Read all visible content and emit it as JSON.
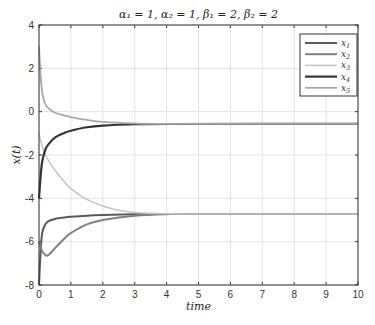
{
  "chart_data": {
    "type": "line",
    "title": "α₁ = 1, α₂ = 1, β₁ = 2, β₂ = 2",
    "xlabel": "time",
    "ylabel": "x(t)",
    "xlim": [
      0,
      10
    ],
    "ylim": [
      -8,
      4
    ],
    "xticks": [
      "0",
      "1",
      "2",
      "3",
      "4",
      "5",
      "6",
      "7",
      "8",
      "9",
      "10"
    ],
    "yticks": [
      "4",
      "2",
      "0",
      "-2",
      "-4",
      "-6",
      "-8"
    ],
    "grid": true,
    "legend_position": "upper right",
    "series": [
      {
        "name": "x1",
        "label_main": "x",
        "label_sub": "1",
        "color": "#5a5a5a",
        "width": 2,
        "x": [
          0,
          0.05,
          0.1,
          0.2,
          0.3,
          0.5,
          0.8,
          1,
          1.5,
          2,
          3,
          4,
          5,
          10
        ],
        "y": [
          -8,
          -6.5,
          -5.6,
          -5.2,
          -5.05,
          -4.95,
          -4.88,
          -4.85,
          -4.8,
          -4.77,
          -4.73,
          -4.72,
          -4.72,
          -4.72
        ]
      },
      {
        "name": "x2",
        "label_main": "x",
        "label_sub": "2",
        "color": "#808080",
        "width": 2,
        "x": [
          0,
          0.05,
          0.1,
          0.2,
          0.25,
          0.35,
          0.5,
          0.8,
          1,
          1.5,
          2,
          3,
          4,
          5,
          10
        ],
        "y": [
          -6,
          -6.2,
          -6.45,
          -6.62,
          -6.65,
          -6.55,
          -6.3,
          -5.85,
          -5.6,
          -5.2,
          -5.0,
          -4.8,
          -4.73,
          -4.72,
          -4.72
        ]
      },
      {
        "name": "x3",
        "label_main": "x",
        "label_sub": "3",
        "color": "#c4c4c4",
        "width": 1.5,
        "x": [
          0,
          0.1,
          0.2,
          0.4,
          0.6,
          0.8,
          1,
          1.5,
          2,
          2.5,
          3,
          4,
          5,
          10
        ],
        "y": [
          -1,
          -1.6,
          -2.0,
          -2.5,
          -2.9,
          -3.25,
          -3.55,
          -4.05,
          -4.35,
          -4.55,
          -4.65,
          -4.71,
          -4.72,
          -4.72
        ]
      },
      {
        "name": "x4",
        "label_main": "x",
        "label_sub": "4",
        "color": "#333333",
        "width": 2.2,
        "x": [
          0,
          0.05,
          0.1,
          0.2,
          0.3,
          0.5,
          0.8,
          1,
          1.5,
          2,
          3,
          4,
          10
        ],
        "y": [
          -4,
          -3.0,
          -2.3,
          -1.75,
          -1.5,
          -1.2,
          -0.98,
          -0.88,
          -0.72,
          -0.64,
          -0.58,
          -0.57,
          -0.56
        ]
      },
      {
        "name": "x5",
        "label_main": "x",
        "label_sub": "5",
        "color": "#a8a8a8",
        "width": 1.8,
        "x": [
          0,
          0.03,
          0.06,
          0.1,
          0.15,
          0.2,
          0.3,
          0.5,
          0.8,
          1,
          1.5,
          2,
          3,
          4,
          10
        ],
        "y": [
          3,
          2.2,
          1.5,
          0.9,
          0.55,
          0.35,
          0.15,
          -0.05,
          -0.18,
          -0.25,
          -0.38,
          -0.47,
          -0.54,
          -0.56,
          -0.56
        ]
      }
    ]
  },
  "plot": {
    "left": 39,
    "right": 358,
    "top": 25,
    "bottom": 285
  }
}
